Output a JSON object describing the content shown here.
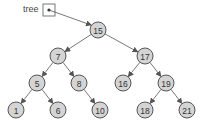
{
  "diagram": {
    "type": "binary-search-tree",
    "pointer_label": "tree",
    "root": "15",
    "nodes": [
      {
        "id": "n15",
        "value": "15",
        "x": 98,
        "y": 30
      },
      {
        "id": "n7",
        "value": "7",
        "x": 58,
        "y": 56
      },
      {
        "id": "n17",
        "value": "17",
        "x": 145,
        "y": 56
      },
      {
        "id": "n5",
        "value": "5",
        "x": 37,
        "y": 83
      },
      {
        "id": "n8",
        "value": "8",
        "x": 79,
        "y": 83
      },
      {
        "id": "n16",
        "value": "16",
        "x": 123,
        "y": 83
      },
      {
        "id": "n19",
        "value": "19",
        "x": 166,
        "y": 83
      },
      {
        "id": "n1",
        "value": "1",
        "x": 16,
        "y": 110
      },
      {
        "id": "n6",
        "value": "6",
        "x": 58,
        "y": 110
      },
      {
        "id": "n10",
        "value": "10",
        "x": 100,
        "y": 110
      },
      {
        "id": "n18",
        "value": "18",
        "x": 145,
        "y": 110
      },
      {
        "id": "n21",
        "value": "21",
        "x": 187,
        "y": 110
      }
    ],
    "edges": [
      [
        "n15",
        "n7"
      ],
      [
        "n15",
        "n17"
      ],
      [
        "n7",
        "n5"
      ],
      [
        "n7",
        "n8"
      ],
      [
        "n17",
        "n16"
      ],
      [
        "n17",
        "n19"
      ],
      [
        "n5",
        "n1"
      ],
      [
        "n5",
        "n6"
      ],
      [
        "n8",
        "n10"
      ],
      [
        "n19",
        "n18"
      ],
      [
        "n19",
        "n21"
      ]
    ]
  }
}
